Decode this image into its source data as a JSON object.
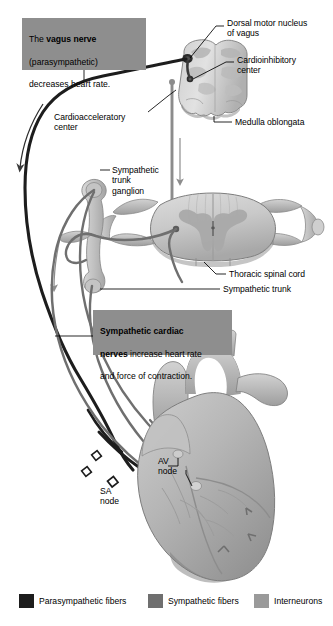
{
  "figure": {
    "type": "anatomical-diagram"
  },
  "callouts": [
    {
      "id": "vagus-callout",
      "text_plain": "The vagus nerve (parasympathetic) decreases heart rate.",
      "line1_pre": "The ",
      "line1_bold": "vagus nerve",
      "line2": "(parasympathetic)",
      "line3": "decreases heart rate.",
      "bg": "#8e8e8e"
    },
    {
      "id": "sympathetic-callout",
      "text_plain": "Sympathetic cardiac nerves increase heart rate and force of contraction.",
      "line1_bold": "Sympathetic cardiac",
      "line2_bold": "nerves",
      "line2_rest": " increase heart rate",
      "line3": "and force of contraction.",
      "bg": "#8e8e8e"
    }
  ],
  "labels": {
    "dorsal_motor_nucleus": "Dorsal motor nucleus\nof vagus",
    "cardioinhibitory_center": "Cardioinhibitory\ncenter",
    "cardioacceleratory_center": "Cardioacceleratory\ncenter",
    "medulla_oblongata": "Medulla oblongata",
    "sympathetic_trunk_ganglion": "Sympathetic\ntrunk\nganglion",
    "thoracic_spinal_cord": "Thoracic spinal cord",
    "sympathetic_trunk": "Sympathetic trunk",
    "av_node": "AV\nnode",
    "sa_node": "SA\nnode"
  },
  "legend": {
    "items": [
      {
        "label": "Parasympathetic fibers",
        "color": "#1d1d1d"
      },
      {
        "label": "Sympathetic fibers",
        "color": "#6f6f6f"
      },
      {
        "label": "Interneurons",
        "color": "#9a9a9a"
      }
    ]
  },
  "colors": {
    "parasympathetic": "#1d1d1d",
    "sympathetic": "#6f6f6f",
    "interneuron": "#9a9a9a",
    "callout_bg": "#8e8e8e",
    "tissue_light": "#d8d8d8",
    "tissue_mid": "#bcbcbc",
    "tissue_dark": "#9d9d9d",
    "outline": "#7a7a7a",
    "leader": "#000000",
    "background": "#ffffff"
  }
}
